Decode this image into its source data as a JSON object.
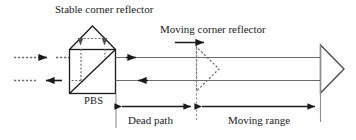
{
  "figure": {
    "type": "optical-interferometer-diagram",
    "width": 356,
    "height": 140,
    "background": "#ffffff",
    "line_color": "#4d4d4d",
    "dark_line_color": "#1a1a1a",
    "dashed_color": "#6b6b6b",
    "text_color": "#1a1a1a"
  },
  "labels": {
    "stable_corner_reflector": "Stable corner reflector",
    "moving_corner_reflector": "Moving corner reflector",
    "pbs": "PBS",
    "dead_path": "Dead path",
    "moving_range": "Moving range"
  },
  "components": [
    {
      "name": "stable-corner-reflector",
      "shape": "triangle-up",
      "style": "solid"
    },
    {
      "name": "polarizing-beam-splitter",
      "shape": "square-with-diagonal",
      "style": "solid"
    },
    {
      "name": "moving-corner-reflector-start",
      "shape": "triangle-right",
      "style": "dashed"
    },
    {
      "name": "moving-corner-reflector-end",
      "shape": "triangle-right",
      "style": "solid"
    }
  ],
  "beams": [
    {
      "name": "input-beam",
      "style": "dashed",
      "direction": "right"
    },
    {
      "name": "output-beam",
      "style": "dashed",
      "direction": "left"
    },
    {
      "name": "measurement-beam-forward",
      "style": "solid",
      "direction": "right"
    },
    {
      "name": "measurement-beam-return",
      "style": "solid",
      "direction": "left"
    },
    {
      "name": "reference-beam-internal",
      "style": "dashed",
      "direction": "down"
    }
  ],
  "dimensions": [
    {
      "name": "dead-path",
      "label": "Dead path",
      "arrow": "double-headed"
    },
    {
      "name": "moving-range",
      "label": "Moving range",
      "arrow": "double-headed"
    }
  ],
  "motion_arrow": {
    "name": "moving-direction-arrow",
    "direction": "right"
  }
}
